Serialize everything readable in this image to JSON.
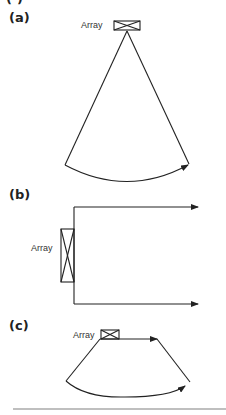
{
  "figure": {
    "cropped_top_label": "(·)",
    "panels": [
      {
        "id": "a",
        "label": "(a)",
        "array_label": "Array",
        "shape": "sector",
        "description": "Sector scan fanning out from a small array at the apex"
      },
      {
        "id": "b",
        "label": "(b)",
        "array_label": "Array",
        "shape": "linear",
        "description": "Linear scan with parallel beams from a vertical array"
      },
      {
        "id": "c",
        "label": "(c)",
        "array_label": "Array",
        "shape": "trapezoidal",
        "description": "Curved/trapezoidal scan from a small array"
      }
    ],
    "colors": {
      "stroke": "#222222",
      "rule": "#aaaaaa",
      "background": "#ffffff"
    }
  }
}
